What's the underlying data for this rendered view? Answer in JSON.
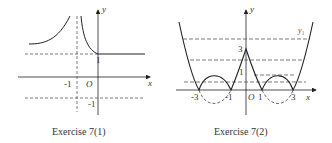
{
  "figures": [
    {
      "id": "fig1",
      "caption": "Exercise 7(1)",
      "labels": {
        "y_axis": "y",
        "x_axis": "x",
        "origin": "O",
        "y_one": "1",
        "y_neg_one": "-1",
        "x_neg_one": "-1"
      }
    },
    {
      "id": "fig2",
      "caption": "Exercise 7(2)",
      "labels": {
        "y_axis": "y",
        "x_axis": "x",
        "origin": "O",
        "y_three": "3",
        "y_one": "1",
        "y1": "y₁",
        "x_neg_three": "-3",
        "x_neg_one": "-1",
        "x_one": "1",
        "x_three": "3"
      }
    }
  ]
}
